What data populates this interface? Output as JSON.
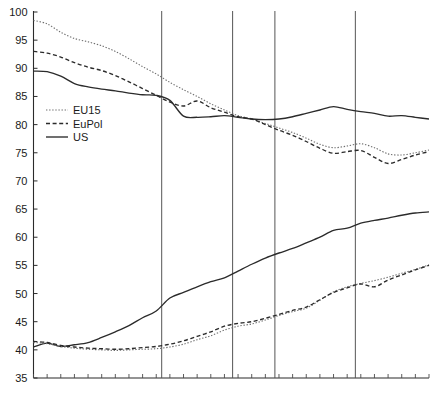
{
  "chart_data": {
    "type": "line",
    "title": "",
    "subtitle": "",
    "xlabel": "",
    "ylabel": "",
    "ylim": [
      35,
      100
    ],
    "ytick_step": 5,
    "ytick_labels": [
      "100",
      "95",
      "90",
      "85",
      "80",
      "75",
      "70",
      "65",
      "60",
      "55",
      "50",
      "45",
      "40",
      "35"
    ],
    "ytick_values": [
      100,
      95,
      90,
      85,
      80,
      75,
      70,
      65,
      60,
      55,
      50,
      45,
      40,
      35
    ],
    "xlim": [
      0,
      29
    ],
    "xtick_labels": [],
    "x_minor_tick_count": 30,
    "grid": false,
    "legend_position": "upper-left-inside",
    "legend_entries": [
      {
        "name": "EU15",
        "style": "dotted"
      },
      {
        "name": "EuPol",
        "style": "dashed"
      },
      {
        "name": "US",
        "style": "solid"
      }
    ],
    "vertical_reference_lines_x": [
      9.4,
      14.6,
      17.7,
      23.6
    ],
    "x": [
      0,
      1,
      2,
      3,
      4,
      5,
      6,
      7,
      8,
      9,
      10,
      11,
      12,
      13,
      14,
      15,
      16,
      17,
      18,
      19,
      20,
      21,
      22,
      23,
      24,
      25,
      26,
      27,
      28,
      29
    ],
    "series": [
      {
        "name": "EU15-upper",
        "group": "upper",
        "style": "dotted",
        "values": [
          98.5,
          97.9,
          96.4,
          95.3,
          94.7,
          94.0,
          93.0,
          91.7,
          90.3,
          89.0,
          87.5,
          86.2,
          85.0,
          83.7,
          82.6,
          81.6,
          81.0,
          80.2,
          79.4,
          78.6,
          77.6,
          76.5,
          75.9,
          76.2,
          76.6,
          75.9,
          74.8,
          74.6,
          75.0,
          75.5
        ]
      },
      {
        "name": "EuPol-upper",
        "group": "upper",
        "style": "dashed",
        "values": [
          93.0,
          92.7,
          92.0,
          91.0,
          90.2,
          89.6,
          88.7,
          87.6,
          86.4,
          85.2,
          84.0,
          83.3,
          84.2,
          83.0,
          82.2,
          81.4,
          81.0,
          80.0,
          79.0,
          78.1,
          77.0,
          75.8,
          74.9,
          75.2,
          75.4,
          74.2,
          73.1,
          73.8,
          74.6,
          75.2
        ]
      },
      {
        "name": "US-upper",
        "group": "upper",
        "style": "solid",
        "values": [
          89.5,
          89.4,
          88.6,
          87.3,
          86.7,
          86.3,
          86.0,
          85.6,
          85.3,
          85.2,
          84.3,
          81.5,
          81.3,
          81.4,
          81.6,
          81.3,
          81.0,
          80.9,
          81.0,
          81.4,
          82.0,
          82.6,
          83.2,
          82.7,
          82.3,
          82.0,
          81.5,
          81.6,
          81.3,
          81.0
        ]
      },
      {
        "name": "US-lower",
        "group": "lower",
        "style": "solid",
        "values": [
          40.5,
          41.2,
          40.6,
          40.9,
          41.3,
          42.2,
          43.2,
          44.3,
          45.7,
          46.9,
          49.2,
          50.2,
          51.2,
          52.1,
          52.8,
          54.0,
          55.2,
          56.3,
          57.2,
          58.0,
          59.0,
          60.0,
          61.2,
          61.6,
          62.5,
          63.0,
          63.4,
          63.9,
          64.3,
          64.5
        ]
      },
      {
        "name": "EU15-lower",
        "group": "lower",
        "style": "dotted",
        "values": [
          41.3,
          41.1,
          40.6,
          40.3,
          40.1,
          40.0,
          39.9,
          40.0,
          40.1,
          40.2,
          40.5,
          41.0,
          41.8,
          42.5,
          43.5,
          44.2,
          44.6,
          45.3,
          46.1,
          46.8,
          47.4,
          48.8,
          50.3,
          51.2,
          51.8,
          52.3,
          52.9,
          53.6,
          54.3,
          55.1
        ]
      },
      {
        "name": "EuPol-lower",
        "group": "lower",
        "style": "dashed",
        "values": [
          41.5,
          41.3,
          40.8,
          40.5,
          40.3,
          40.2,
          40.1,
          40.2,
          40.4,
          40.6,
          41.0,
          41.6,
          42.4,
          43.2,
          44.2,
          44.7,
          45.0,
          45.6,
          46.3,
          47.0,
          47.6,
          48.9,
          50.2,
          51.0,
          51.7,
          51.2,
          52.4,
          53.3,
          54.2,
          55.0
        ]
      }
    ]
  }
}
